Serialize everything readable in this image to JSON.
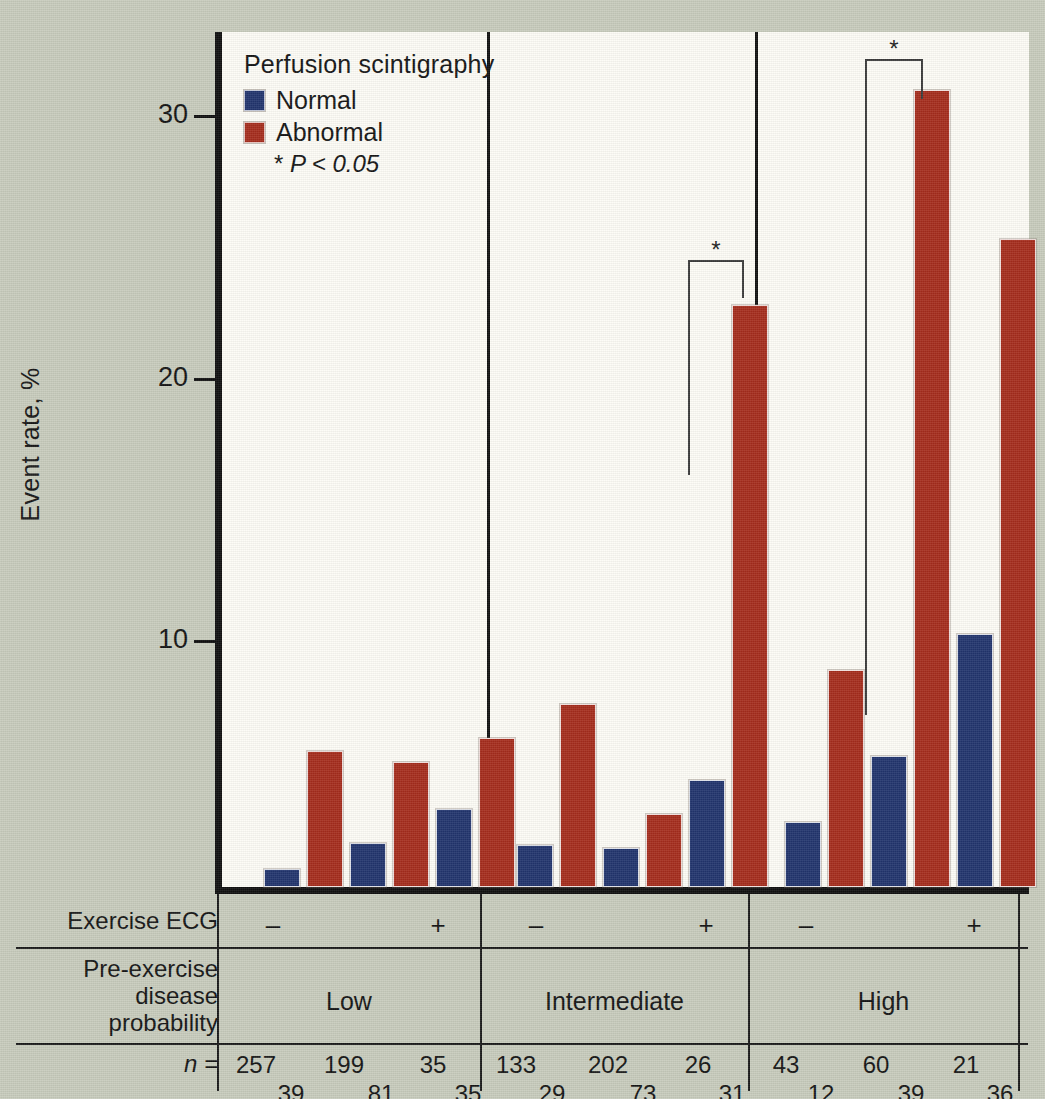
{
  "legend": {
    "title": "Perfusion scintigraphy",
    "items": [
      {
        "label": "Normal",
        "color": "#22356e"
      },
      {
        "label": "Abnormal",
        "color": "#a62d1d"
      }
    ],
    "note_star": "*",
    "note_text": "P < 0.05",
    "note_full": "* P < 0.05"
  },
  "axis": {
    "y_title": "Event rate, %",
    "ticks": [
      "30",
      "20",
      "10"
    ]
  },
  "table": {
    "row1_label": "Exercise ECG",
    "row2_label_line1": "Pre-exercise",
    "row2_label_line2": "disease",
    "row2_label_line3": "probability",
    "row3_label": "n =",
    "ecg_signs": [
      "–",
      "+",
      "–",
      "+",
      "–",
      "+"
    ],
    "groups": [
      "Low",
      "Intermediate",
      "High"
    ],
    "n_top": [
      "257",
      "199",
      "35",
      "133",
      "202",
      "26",
      "43",
      "60",
      "21"
    ],
    "n_bottom": [
      "39",
      "81",
      "35",
      "29",
      "73",
      "31",
      "12",
      "39",
      "36"
    ]
  },
  "brackets": [
    {
      "star": "*"
    },
    {
      "star": "*"
    }
  ],
  "chart_data": {
    "type": "bar",
    "title": "",
    "xlabel": "",
    "ylabel": "Event rate, %",
    "ylim": [
      0,
      33
    ],
    "yticks": [
      10,
      20,
      30
    ],
    "grid": false,
    "legend_position": "top-left",
    "legend_title": "Perfusion scintigraphy",
    "annotations": [
      "* P < 0.05"
    ],
    "groups": [
      {
        "name": "Low",
        "subgroups": [
          {
            "exercise_ecg": "–",
            "n_normal": 257,
            "n_abnormal": 39,
            "normal": 0.7,
            "abnormal": 5.2,
            "significant": false
          },
          {
            "exercise_ecg": "–",
            "n_normal": 199,
            "n_abnormal": 81,
            "normal": 1.7,
            "abnormal": 4.8,
            "significant": false
          },
          {
            "exercise_ecg": "+",
            "n_normal": 35,
            "n_abnormal": 35,
            "normal": 3.0,
            "abnormal": 5.7,
            "significant": false
          }
        ]
      },
      {
        "name": "Intermediate",
        "subgroups": [
          {
            "exercise_ecg": "–",
            "n_normal": 133,
            "n_abnormal": 29,
            "normal": 1.6,
            "abnormal": 7.0,
            "significant": false
          },
          {
            "exercise_ecg": "–",
            "n_normal": 202,
            "n_abnormal": 73,
            "normal": 1.5,
            "abnormal": 2.8,
            "significant": false
          },
          {
            "exercise_ecg": "+",
            "n_normal": 26,
            "n_abnormal": 31,
            "normal": 4.1,
            "abnormal": 22.3,
            "significant": true
          }
        ]
      },
      {
        "name": "High",
        "subgroups": [
          {
            "exercise_ecg": "–",
            "n_normal": 43,
            "n_abnormal": 12,
            "normal": 2.5,
            "abnormal": 8.3,
            "significant": false
          },
          {
            "exercise_ecg": "–",
            "n_normal": 60,
            "n_abnormal": 39,
            "normal": 5.0,
            "abnormal": 30.5,
            "significant": true
          },
          {
            "exercise_ecg": "+",
            "n_normal": 21,
            "n_abnormal": 36,
            "normal": 9.7,
            "abnormal": 24.8,
            "significant": false
          }
        ]
      }
    ],
    "series": [
      {
        "name": "Normal",
        "color": "#22356e",
        "values": [
          0.7,
          1.7,
          3.0,
          1.6,
          1.5,
          4.1,
          2.5,
          5.0,
          9.7
        ]
      },
      {
        "name": "Abnormal",
        "color": "#a62d1d",
        "values": [
          5.2,
          4.8,
          5.7,
          7.0,
          2.8,
          22.3,
          8.3,
          30.5,
          24.8
        ]
      }
    ],
    "categories": [
      "Low / – / 257-39",
      "Low / – / 199-81",
      "Low / + / 35-35",
      "Intermediate / – / 133-29",
      "Intermediate / – / 202-73",
      "Intermediate / + / 26-31",
      "High / – / 43-12",
      "High / – / 60-39",
      "High / + / 21-36"
    ]
  }
}
